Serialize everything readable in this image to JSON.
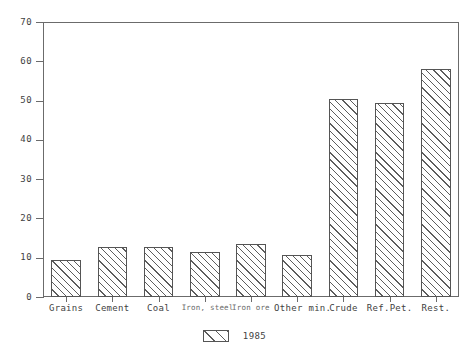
{
  "chart_data": {
    "type": "bar",
    "title": "",
    "xlabel": "",
    "ylabel": "",
    "ylim": [
      0,
      70
    ],
    "ytick_step": 10,
    "yticks": [
      0,
      10,
      20,
      30,
      40,
      50,
      60,
      70
    ],
    "grid": false,
    "legend_position": "bottom-center",
    "categories": [
      "Grains",
      "Cement",
      "Coal",
      "Iron, steel",
      "Iron ore",
      "Other min.",
      "Crude",
      "Ref.Pet.",
      "Rest."
    ],
    "series": [
      {
        "name": "1985",
        "values": [
          9.4,
          12.8,
          12.8,
          11.4,
          13.6,
          10.7,
          50.5,
          49.5,
          58.0
        ]
      }
    ],
    "bar_style": {
      "fill": "#ffffff",
      "edge": "#555555",
      "hatch": "/"
    }
  },
  "legend": {
    "entries": [
      {
        "label": "1985",
        "swatch": "hatch-diagonal-swatch"
      }
    ]
  },
  "axes": {
    "frame_color": "#6b6b6b",
    "tick_color": "#6b6b6b",
    "label_color": "#3f3f3f"
  }
}
